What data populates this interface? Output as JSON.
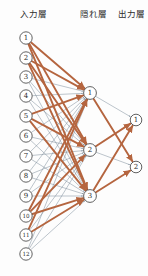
{
  "figure": {
    "background": "#fdfdfd",
    "width": 148,
    "height": 276
  },
  "labels": {
    "input_layer": "入力層",
    "hidden_layer": "隠れ層",
    "output_layer": "出力層"
  },
  "colors": {
    "edge_weak": "#7b8a99",
    "edge_strong": "#b5653f",
    "node_stroke": "#3a3a3a",
    "node_fill": "#ffffff",
    "text": "#2b2b2b"
  },
  "chart_data": {
    "type": "diagram",
    "layers": [
      {
        "name": "入力層",
        "label_x": 20,
        "label_y": 17,
        "node_count": 12,
        "node_x": 26,
        "node_radius": 6.2,
        "nodes": [
          {
            "id": "1",
            "label": "1",
            "x": 26,
            "y": 38
          },
          {
            "id": "2",
            "label": "2",
            "x": 26,
            "y": 58
          },
          {
            "id": "3",
            "label": "3",
            "x": 26,
            "y": 77
          },
          {
            "id": "4",
            "label": "4",
            "x": 26,
            "y": 96
          },
          {
            "id": "5",
            "label": "5",
            "x": 26,
            "y": 116
          },
          {
            "id": "6",
            "label": "6",
            "x": 26,
            "y": 136
          },
          {
            "id": "7",
            "label": "7",
            "x": 26,
            "y": 156
          },
          {
            "id": "8",
            "label": "8",
            "x": 26,
            "y": 176
          },
          {
            "id": "9",
            "label": "9",
            "x": 26,
            "y": 196
          },
          {
            "id": "10",
            "label": "10",
            "x": 26,
            "y": 216
          },
          {
            "id": "11",
            "label": "11",
            "x": 26,
            "y": 235
          },
          {
            "id": "12",
            "label": "12",
            "x": 26,
            "y": 254
          }
        ]
      },
      {
        "name": "隠れ層",
        "label_x": 80,
        "label_y": 17,
        "node_count": 3,
        "node_x": 90,
        "node_radius": 6.4,
        "nodes": [
          {
            "id": "h1",
            "label": "1",
            "x": 90,
            "y": 93
          },
          {
            "id": "h2",
            "label": "2",
            "x": 90,
            "y": 150
          },
          {
            "id": "h3",
            "label": "3",
            "x": 90,
            "y": 196
          }
        ]
      },
      {
        "name": "出力層",
        "label_x": 118,
        "label_y": 17,
        "node_count": 2,
        "node_x": 136,
        "node_radius": 5.8,
        "nodes": [
          {
            "id": "o1",
            "label": "1",
            "x": 136,
            "y": 120
          },
          {
            "id": "o2",
            "label": "2",
            "x": 136,
            "y": 167
          }
        ]
      }
    ],
    "edge_styles": {
      "weak": {
        "color": "#7b8a99",
        "width": 0.5,
        "description": "細い灰色の線 (小さい重み)"
      },
      "strong": {
        "color": "#b5653f",
        "width": 1.9,
        "description": "太い茶色の矢印 (大きい重み)"
      }
    },
    "edges_input_to_hidden": [
      {
        "from": "1",
        "to": "h1",
        "style": "strong"
      },
      {
        "from": "1",
        "to": "h2",
        "style": "strong"
      },
      {
        "from": "1",
        "to": "h3",
        "style": "strong"
      },
      {
        "from": "2",
        "to": "h1",
        "style": "strong"
      },
      {
        "from": "2",
        "to": "h2",
        "style": "strong"
      },
      {
        "from": "2",
        "to": "h3",
        "style": "strong"
      },
      {
        "from": "3",
        "to": "h1",
        "style": "weak"
      },
      {
        "from": "3",
        "to": "h2",
        "style": "weak"
      },
      {
        "from": "3",
        "to": "h3",
        "style": "weak"
      },
      {
        "from": "4",
        "to": "h1",
        "style": "weak"
      },
      {
        "from": "4",
        "to": "h2",
        "style": "weak"
      },
      {
        "from": "4",
        "to": "h3",
        "style": "weak"
      },
      {
        "from": "5",
        "to": "h1",
        "style": "strong"
      },
      {
        "from": "5",
        "to": "h2",
        "style": "strong"
      },
      {
        "from": "5",
        "to": "h3",
        "style": "strong"
      },
      {
        "from": "6",
        "to": "h1",
        "style": "weak"
      },
      {
        "from": "6",
        "to": "h2",
        "style": "weak"
      },
      {
        "from": "6",
        "to": "h3",
        "style": "weak"
      },
      {
        "from": "7",
        "to": "h1",
        "style": "weak"
      },
      {
        "from": "7",
        "to": "h2",
        "style": "weak"
      },
      {
        "from": "7",
        "to": "h3",
        "style": "weak"
      },
      {
        "from": "8",
        "to": "h1",
        "style": "weak"
      },
      {
        "from": "8",
        "to": "h2",
        "style": "weak"
      },
      {
        "from": "8",
        "to": "h3",
        "style": "weak"
      },
      {
        "from": "9",
        "to": "h1",
        "style": "weak"
      },
      {
        "from": "9",
        "to": "h2",
        "style": "weak"
      },
      {
        "from": "9",
        "to": "h3",
        "style": "weak"
      },
      {
        "from": "10",
        "to": "h1",
        "style": "strong"
      },
      {
        "from": "10",
        "to": "h2",
        "style": "strong"
      },
      {
        "from": "10",
        "to": "h3",
        "style": "strong"
      },
      {
        "from": "11",
        "to": "h1",
        "style": "strong"
      },
      {
        "from": "11",
        "to": "h2",
        "style": "weak"
      },
      {
        "from": "11",
        "to": "h3",
        "style": "strong"
      },
      {
        "from": "12",
        "to": "h1",
        "style": "weak"
      },
      {
        "from": "12",
        "to": "h2",
        "style": "weak"
      },
      {
        "from": "12",
        "to": "h3",
        "style": "weak"
      }
    ],
    "edges_hidden_to_output": [
      {
        "from": "h1",
        "to": "o1",
        "style": "weak"
      },
      {
        "from": "h1",
        "to": "o2",
        "style": "strong"
      },
      {
        "from": "h2",
        "to": "o1",
        "style": "strong"
      },
      {
        "from": "h2",
        "to": "o2",
        "style": "weak"
      },
      {
        "from": "h3",
        "to": "o1",
        "style": "strong"
      },
      {
        "from": "h3",
        "to": "o2",
        "style": "strong"
      }
    ]
  }
}
